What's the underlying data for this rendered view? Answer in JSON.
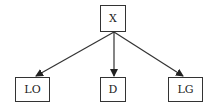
{
  "diagram": {
    "type": "tree",
    "colors": {
      "line": "#333333",
      "box_border": "#333333",
      "text": "#222222",
      "background": "#ffffff"
    },
    "nodes": [
      {
        "id": "X",
        "label": "X"
      },
      {
        "id": "LO",
        "label": "LO"
      },
      {
        "id": "D",
        "label": "D"
      },
      {
        "id": "LG",
        "label": "LG"
      }
    ],
    "edges": [
      {
        "from": "X",
        "to": "LO"
      },
      {
        "from": "X",
        "to": "D"
      },
      {
        "from": "X",
        "to": "LG"
      }
    ]
  }
}
